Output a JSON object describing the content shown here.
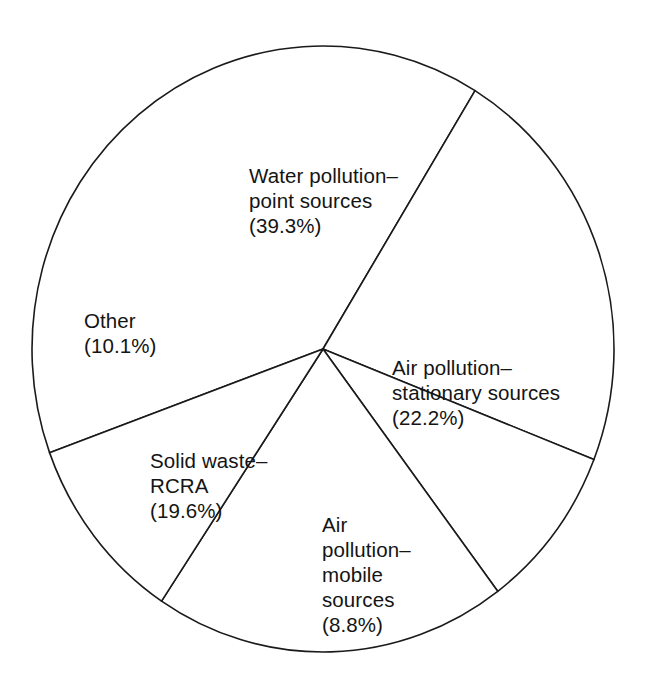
{
  "chart_data": {
    "type": "pie",
    "title": "",
    "subtitle": "",
    "xlabel": "",
    "ylabel": "",
    "legend_position": "none",
    "grid": false,
    "units": "percent",
    "categories": [
      "Water pollution–point sources",
      "Air pollution–stationary sources",
      "Air pollution–mobile sources",
      "Solid waste–RCRA",
      "Other"
    ],
    "values": [
      39.3,
      22.2,
      8.8,
      19.6,
      10.1
    ],
    "slices": [
      {
        "key": "water",
        "label_lines": [
          "Water pollution–",
          "point sources",
          "(39.3%)"
        ],
        "value": 39.3,
        "value_text": "(39.3%)",
        "start_angle": 160.0,
        "sweep_angle": 141.5,
        "fill": "#ffffff",
        "stroke": "#1a1a1a"
      },
      {
        "key": "air-stationary",
        "label_lines": [
          "Air pollution–",
          "stationary sources",
          "(22.2%)"
        ],
        "value": 22.2,
        "value_text": "(22.2%)",
        "start_angle": 301.5,
        "sweep_angle": 79.9,
        "fill": "#ffffff",
        "stroke": "#1a1a1a"
      },
      {
        "key": "air-mobile",
        "label_lines": [
          "Air",
          "pollution–",
          "mobile",
          "sources",
          "(8.8%)"
        ],
        "value": 8.8,
        "value_text": "(8.8%)",
        "start_angle": 21.4,
        "sweep_angle": 31.7,
        "fill": "#ffffff",
        "stroke": "#1a1a1a"
      },
      {
        "key": "solid-waste",
        "label_lines": [
          "Solid waste–",
          "RCRA",
          "(19.6%)"
        ],
        "value": 19.6,
        "value_text": "(19.6%)",
        "start_angle": 53.1,
        "sweep_angle": 70.6,
        "fill": "#ffffff",
        "stroke": "#1a1a1a"
      },
      {
        "key": "other",
        "label_lines": [
          "Other",
          "(10.1%)"
        ],
        "value": 10.1,
        "value_text": "(10.1%)",
        "start_angle": 123.7,
        "sweep_angle": 36.3,
        "fill": "#ffffff",
        "stroke": "#1a1a1a"
      }
    ],
    "geometry": {
      "center_x": 323,
      "center_y": 349,
      "radius_x": 291,
      "radius_y": 303
    }
  },
  "labels": {
    "water": "Water pollution–\npoint sources\n(39.3%)",
    "air_stationary": "Air pollution–\nstationary sources\n(22.2%)",
    "air_mobile": "Air\npollution–\nmobile\nsources\n(8.8%)",
    "solid_waste": "Solid waste–\nRCRA\n(19.6%)",
    "other": "Other\n(10.1%)"
  },
  "colors": {
    "background": "#ffffff",
    "outline": "#1a1a1a",
    "text": "#141414"
  }
}
